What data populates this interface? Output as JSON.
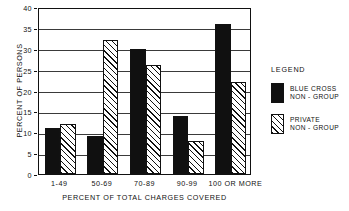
{
  "chart_data": {
    "type": "bar",
    "title": "",
    "xlabel": "PERCENT OF TOTAL CHARGES COVERED",
    "ylabel": "PERCENT OF PERSONS",
    "categories": [
      "1-49",
      "50-69",
      "70-89",
      "90-99",
      "100 OR MORE"
    ],
    "series": [
      {
        "name": "BLUE CROSS NON-GROUP",
        "values": [
          11,
          9,
          30,
          14,
          36
        ],
        "fill": "solid-black"
      },
      {
        "name": "PRIVATE NON-GROUP",
        "values": [
          12,
          32,
          26,
          8,
          22
        ],
        "fill": "diagonal-hatch"
      }
    ],
    "ylim": [
      0,
      40
    ],
    "yticks": [
      0,
      5,
      10,
      15,
      20,
      25,
      30,
      35,
      40
    ],
    "ytick_labels": [
      "0",
      "5",
      "10",
      "15",
      "20",
      "25",
      "30",
      "35",
      "40"
    ],
    "grid": true,
    "grid_axis": "y",
    "legend_position": "right",
    "colors": {
      "series1": "#101010",
      "series2": "#ffffff",
      "axis": "#111111",
      "grid": "#3a3a3a"
    }
  },
  "legend": {
    "title": "LEGEND",
    "entries": [
      {
        "line1": "BLUE CROSS",
        "line2": "NON - GROUP",
        "swatch": "solid-black-swatch"
      },
      {
        "line1": "PRIVATE",
        "line2": "NON - GROUP",
        "swatch": "hatched-swatch"
      }
    ]
  }
}
